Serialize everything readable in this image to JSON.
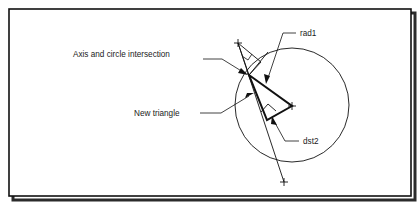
{
  "figure": {
    "background_color": "#ffffff",
    "line_color": "#111111",
    "frame": {
      "x": 9,
      "y": 9,
      "width": 402,
      "height": 187,
      "border_color": "#111111",
      "shadow_color": "#2b2b2b"
    },
    "labels": [
      {
        "id": "axis-and-circle-intersection",
        "text": "Axis and circle intersection",
        "x": 73,
        "y": 57
      },
      {
        "id": "rad1",
        "text": "rad1",
        "x": 300,
        "y": 36
      },
      {
        "id": "new-triangle",
        "text": "New triangle",
        "x": 134,
        "y": 116
      },
      {
        "id": "dst2",
        "text": "dst2",
        "x": 303,
        "y": 144
      }
    ],
    "geometry": {
      "circle": {
        "center_x": 292,
        "center_y": 105,
        "radius": 57,
        "stroke_width": 0.9
      },
      "center_marker": {
        "x": 292,
        "y": 106,
        "arm": 4
      },
      "intersection_point": {
        "x": 249,
        "y": 75
      },
      "axis_line": {
        "x1": 238,
        "y1": 43,
        "x2": 284,
        "y2": 182,
        "stroke_width": 0.9
      },
      "axis_end_marker_top": {
        "x": 238,
        "y": 43,
        "arm": 4
      },
      "axis_end_marker_bottom": {
        "x": 284,
        "y": 182,
        "arm": 4
      },
      "new_triangle": {
        "points": "249,75 292,106 267,120",
        "stroke_width": 2.0
      },
      "right_angle_marker": {
        "points": "262,111 268,104 275,110",
        "stroke_width": 0.9
      },
      "thin_triangle": {
        "points": "238,43 249,75 260,63",
        "stroke_width": 0.9
      },
      "small_angle_marker": {
        "points": "243,57 249,61 252,55",
        "stroke_width": 0.8
      }
    },
    "leaders": [
      {
        "id": "leader-axis-intersection",
        "path": "M 203,59 L 222,59 L 243,72",
        "arrow": {
          "x": 247,
          "y": 74,
          "angle": 32
        }
      },
      {
        "id": "leader-rad1",
        "path": "M 296,33 L 283,33 L 268,78",
        "arrow": {
          "x": 266,
          "y": 83,
          "angle": 108
        }
      },
      {
        "id": "leader-new-triangle",
        "path": "M 200,113 L 221,113 L 249,96",
        "arrow": {
          "x": 254,
          "y": 93,
          "angle": -31
        }
      },
      {
        "id": "leader-dst2",
        "path": "M 299,141 L 285,141 L 274,121",
        "arrow": {
          "x": 272,
          "y": 117,
          "angle": -119
        }
      }
    ]
  }
}
